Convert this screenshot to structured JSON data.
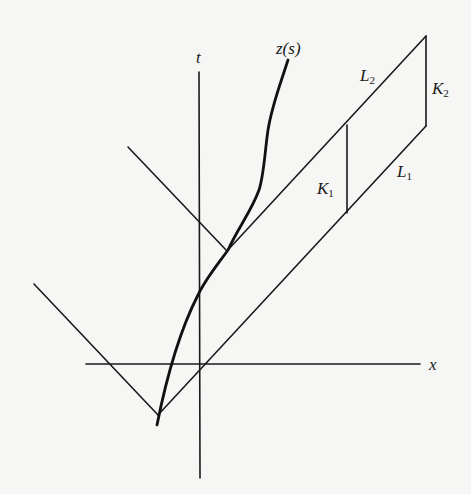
{
  "diagram": {
    "type": "spacetime-diagram",
    "axes": {
      "t_label": "t",
      "x_label": "x"
    },
    "curve_label": "z(s)",
    "labels": {
      "L2": {
        "main": "L",
        "sub": "2"
      },
      "K2": {
        "main": "K",
        "sub": "2"
      },
      "K1": {
        "main": "K",
        "sub": "1"
      },
      "L1": {
        "main": "L",
        "sub": "1"
      }
    },
    "colors": {
      "ink": "#1a1a1a",
      "paper": "#f6f6f4"
    }
  }
}
